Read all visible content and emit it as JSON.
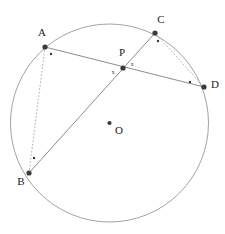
{
  "figure": {
    "kind": "circle-geometry-diagram",
    "width": 225,
    "height": 234,
    "background_color": "#ffffff",
    "stroke_color": "#6e6e6e",
    "point_color": "#3a3a3a",
    "label_color": "#1a1a1a"
  },
  "circle": {
    "name": "main-circle",
    "center_label": "O",
    "cx": 109.5,
    "cy": 123,
    "r": 99,
    "stroke": "#8a8a8a",
    "stroke_width": 0.8
  },
  "points": [
    {
      "id": "A",
      "label": "A",
      "x": 45,
      "y": 47,
      "label_x": 42,
      "label_y": 33,
      "on_circle": true
    },
    {
      "id": "B",
      "label": "B",
      "x": 29,
      "y": 173,
      "label_x": 21,
      "label_y": 182,
      "on_circle": true
    },
    {
      "id": "C",
      "label": "C",
      "x": 155,
      "y": 33,
      "label_x": 161,
      "label_y": 20,
      "on_circle": true
    },
    {
      "id": "D",
      "label": "D",
      "x": 204,
      "y": 87,
      "label_x": 215,
      "label_y": 85,
      "on_circle": true
    },
    {
      "id": "P",
      "label": "P",
      "x": 123,
      "y": 68,
      "label_x": 122,
      "label_y": 53,
      "on_circle": false
    },
    {
      "id": "O",
      "label": "O",
      "x": 109.5,
      "y": 123,
      "label_x": 119,
      "label_y": 131,
      "on_circle": false
    }
  ],
  "chords": [
    {
      "id": "AD",
      "label": "chord-a-d",
      "from": "A",
      "to": "D",
      "style": "solid",
      "stroke": "#6e6e6e",
      "stroke_width": 0.8
    },
    {
      "id": "CB",
      "label": "chord-c-b",
      "from": "C",
      "to": "B",
      "style": "solid",
      "stroke": "#6e6e6e",
      "stroke_width": 0.8
    },
    {
      "id": "AB",
      "label": "chord-a-b",
      "from": "A",
      "to": "B",
      "style": "dotted",
      "stroke": "#9a9a9a",
      "stroke_width": 0.8
    },
    {
      "id": "CD",
      "label": "chord-c-d",
      "from": "C",
      "to": "D",
      "style": "dotted",
      "stroke": "#9a9a9a",
      "stroke_width": 0.8
    }
  ],
  "angle_markers": {
    "vertical_angle_label": "x",
    "at_p": [
      {
        "id": "x-left",
        "label": "x",
        "x": 113,
        "y": 73
      },
      {
        "id": "x-right",
        "label": "x",
        "x": 132,
        "y": 65
      }
    ],
    "inscribed_dots": [
      {
        "id": "dot-at-a",
        "x": 51,
        "y": 54
      },
      {
        "id": "dot-at-b",
        "x": 34,
        "y": 158
      },
      {
        "id": "dot-at-c",
        "x": 158,
        "y": 41
      },
      {
        "id": "dot-at-d",
        "x": 190,
        "y": 82
      }
    ]
  },
  "chart_data": {
    "type": "scatter",
    "title": "",
    "xlabel": "",
    "ylabel": "",
    "xlim": [
      0,
      225
    ],
    "ylim": [
      234,
      0
    ],
    "grid": false,
    "legend": "none",
    "annotations": [
      "A",
      "B",
      "C",
      "D",
      "P",
      "O",
      "x",
      "x"
    ],
    "series": [
      {
        "name": "circle-points",
        "x": [
          45,
          29,
          155,
          204
        ],
        "y": [
          47,
          173,
          33,
          87
        ],
        "labels": [
          "A",
          "B",
          "C",
          "D"
        ]
      },
      {
        "name": "interior-points",
        "x": [
          123,
          109.5
        ],
        "y": [
          68,
          123
        ],
        "labels": [
          "P",
          "O"
        ]
      }
    ]
  }
}
